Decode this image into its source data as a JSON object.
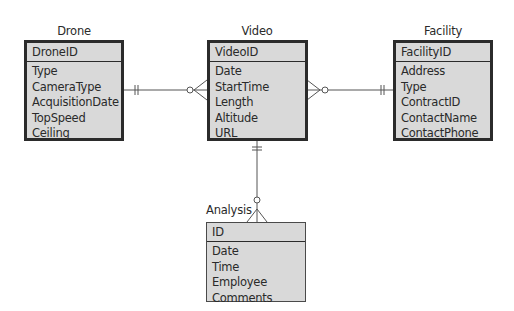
{
  "diagram": {
    "type": "entity-relationship",
    "notation": "crow's foot",
    "entities": [
      {
        "name": "Drone",
        "primary_key": "DroneID",
        "attributes": [
          "Type",
          "CameraType",
          "AcquisitionDate",
          "TopSpeed",
          "Ceiling"
        ]
      },
      {
        "name": "Video",
        "primary_key": "VideoID",
        "attributes": [
          "Date",
          "StartTime",
          "Length",
          "Altitude",
          "URL"
        ]
      },
      {
        "name": "Facility",
        "primary_key": "FacilityID",
        "attributes": [
          "Address",
          "Type",
          "ContractID",
          "ContactName",
          "ContactPhone"
        ]
      },
      {
        "name": "Analysis",
        "primary_key": "ID",
        "attributes": [
          "Date",
          "Time",
          "Employee",
          "Comments"
        ]
      }
    ],
    "relationships": [
      {
        "from": "Drone",
        "to": "Video",
        "from_cardinality": "one and only one",
        "to_cardinality": "zero or many"
      },
      {
        "from": "Facility",
        "to": "Video",
        "from_cardinality": "one and only one",
        "to_cardinality": "zero or many"
      },
      {
        "from": "Video",
        "to": "Analysis",
        "from_cardinality": "one and only one",
        "to_cardinality": "zero or many"
      }
    ],
    "colors": {
      "entity_fill": "#d9d9d9",
      "border": "#2b2b2b",
      "line": "#555555"
    }
  }
}
